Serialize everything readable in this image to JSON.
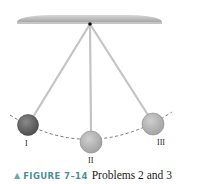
{
  "figure": {
    "caption_marker": "▲",
    "caption_label": "FIGURE 7–14",
    "caption_text": "Problems 2 and 3",
    "colors": {
      "ceiling": "#b9b9b9",
      "string": "#c8c8c8",
      "ball_I": "#6a6a6a",
      "ball_II": "#b5b5b5",
      "ball_III": "#b5b5b5",
      "caption_label": "#4a8f9c",
      "arc": "#555555"
    },
    "positions": [
      {
        "label": "I",
        "cx": 28,
        "cy": 125,
        "r": 10
      },
      {
        "label": "II",
        "cx": 91,
        "cy": 142,
        "r": 11
      },
      {
        "label": "III",
        "cx": 153,
        "cy": 124,
        "r": 11
      }
    ],
    "labels": {
      "I": "I",
      "II": "II",
      "III": "III"
    }
  }
}
